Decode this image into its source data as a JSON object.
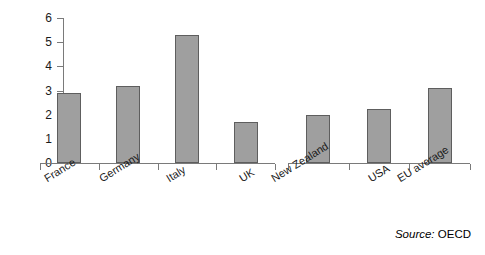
{
  "chart_data": {
    "type": "bar",
    "title": "",
    "subtitle": "",
    "xlabel": "",
    "ylabel": "",
    "categories": [
      "France",
      "Germany",
      "Italy",
      "UK",
      "New Zealand",
      "USA",
      "EU average"
    ],
    "values": [
      2.9,
      3.2,
      5.3,
      1.7,
      2.0,
      2.25,
      3.1
    ],
    "ylim": [
      0,
      6
    ],
    "ytick_labels": [
      "0",
      "1",
      "2",
      "3",
      "4",
      "5",
      "6"
    ],
    "ytick_values": [
      0,
      1,
      2,
      3,
      4,
      5,
      6
    ],
    "grid": false,
    "legend": null,
    "legend_position": "none",
    "group_break_after_index": 3,
    "bar_fill_color": "#9f9f9f",
    "bar_border_color": "#5e5e5e",
    "axis_color": "#7a7a7a",
    "background_color": "#ffffff",
    "label_rotation_deg": -32
  },
  "annotations": {
    "source_label": "Source:",
    "source_value": "OECD"
  }
}
